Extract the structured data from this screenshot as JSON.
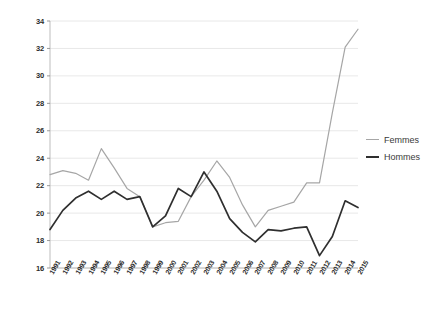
{
  "legend": {
    "entries": [
      {
        "label": "Femmes",
        "color": "#a6a6a6"
      },
      {
        "label": "Hommes",
        "color": "#2f2f2f"
      }
    ]
  },
  "chart_data": {
    "type": "line",
    "title": "",
    "subtitle": "",
    "xlabel": "",
    "ylabel": "",
    "grid": true,
    "legend_position": "right",
    "ylim": [
      16,
      34
    ],
    "yticks": [
      16,
      18,
      20,
      22,
      24,
      26,
      28,
      30,
      32,
      34
    ],
    "categories": [
      "1991",
      "1992",
      "1993",
      "1994",
      "1995",
      "1996",
      "1997",
      "1998",
      "1999",
      "2000",
      "2001",
      "2002",
      "2003",
      "2004",
      "2005",
      "2006",
      "2007",
      "2008",
      "2009",
      "2010",
      "2011",
      "2012",
      "2013",
      "2014",
      "2015"
    ],
    "series": [
      {
        "name": "Femmes",
        "color": "#a6a6a6",
        "values": [
          22.8,
          23.1,
          22.9,
          22.4,
          24.7,
          23.3,
          21.8,
          21.2,
          19.0,
          19.3,
          19.4,
          21.2,
          22.4,
          23.8,
          22.6,
          20.6,
          19.0,
          20.2,
          20.5,
          20.8,
          22.2,
          22.2,
          27.3,
          32.1,
          33.4
        ]
      },
      {
        "name": "Hommes",
        "color": "#2f2f2f",
        "values": [
          18.8,
          20.2,
          21.1,
          21.6,
          21.0,
          21.6,
          21.0,
          21.2,
          19.0,
          19.8,
          21.8,
          21.2,
          23.0,
          21.6,
          19.6,
          18.6,
          17.9,
          18.8,
          18.7,
          18.9,
          19.0,
          16.9,
          18.3,
          20.9,
          20.4
        ]
      }
    ]
  }
}
